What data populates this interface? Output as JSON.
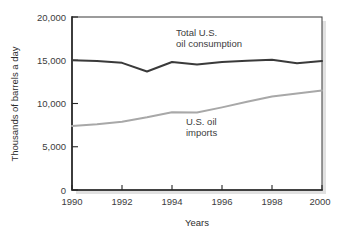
{
  "chart_data": {
    "type": "line",
    "title": "",
    "subtitle": "",
    "xlabel": "Years",
    "ylabel": "Thousands of barrels a day",
    "xlim": [
      1990,
      2000
    ],
    "ylim": [
      0,
      20000
    ],
    "grid": false,
    "legend_position": "inline-annotations",
    "x": [
      1990,
      1991,
      1992,
      1993,
      1994,
      1995,
      1996,
      1997,
      1998,
      1999,
      2000
    ],
    "x_tick_labels": [
      "1990",
      "1992",
      "1994",
      "1996",
      "1998",
      "2000"
    ],
    "x_ticks": [
      1990,
      1992,
      1994,
      1996,
      1998,
      2000
    ],
    "y_tick_labels": [
      "0",
      "5,000",
      "10,000",
      "15,000",
      "20,000"
    ],
    "y_ticks": [
      0,
      5000,
      10000,
      15000,
      20000
    ],
    "series": [
      {
        "name": "Total U.S. oil consumption",
        "color": "#3a3a3a",
        "stroke_width": 2.0,
        "values": [
          15000,
          14900,
          14700,
          13700,
          14800,
          14500,
          14800,
          14950,
          15050,
          14650,
          14900
        ]
      },
      {
        "name": "U.S. oil imports",
        "color": "#a8a8a8",
        "stroke_width": 2.0,
        "values": [
          7400,
          7600,
          7900,
          8400,
          9000,
          8950,
          9550,
          10200,
          10800,
          11150,
          11500
        ]
      }
    ],
    "annotations": [
      {
        "id": "consumption-label",
        "lines": [
          "Total U.S.",
          "oil consumption"
        ],
        "x": 1994.3,
        "y": 18200
      },
      {
        "id": "imports-label",
        "lines": [
          "U.S. oil",
          "imports"
        ],
        "x": 1994.6,
        "y": 7700
      }
    ]
  },
  "axes": {
    "y_axis_title": "Thousands of barrels a day",
    "x_axis_title": "Years"
  },
  "labels": {
    "consumption_line_1": "Total U.S.",
    "consumption_line_2": "oil consumption",
    "imports_line_1": "U.S. oil",
    "imports_line_2": "imports"
  },
  "y_ticks": [
    {
      "label": "20,000",
      "value": 20000
    },
    {
      "label": "15,000",
      "value": 15000
    },
    {
      "label": "10,000",
      "value": 10000
    },
    {
      "label": "5,000",
      "value": 5000
    },
    {
      "label": "0",
      "value": 0
    }
  ],
  "x_ticks": [
    {
      "label": "1990",
      "value": 1990
    },
    {
      "label": "1992",
      "value": 1992
    },
    {
      "label": "1994",
      "value": 1994
    },
    {
      "label": "1996",
      "value": 1996
    },
    {
      "label": "1998",
      "value": 1998
    },
    {
      "label": "2000",
      "value": 2000
    }
  ],
  "colors": {
    "consumption": "#3a3a3a",
    "imports": "#a8a8a8",
    "frame": "#4a4a4a",
    "axis": "#262626",
    "text": "#3c3c3c",
    "background": "#ffffff"
  }
}
